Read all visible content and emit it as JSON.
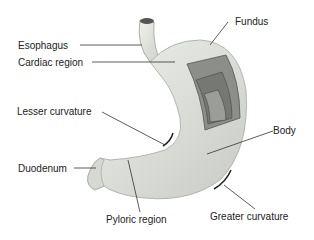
{
  "labels": {
    "esophagus": "Esophagus",
    "cardiac": "Cardiac region",
    "fundus": "Fundus",
    "lesser": "Lesser curvature",
    "body": "Body",
    "duodenum": "Duodenum",
    "pyloric": "Pyloric region",
    "greater": "Greater curvature"
  },
  "colors": {
    "organ_fill": "#e4e6e2",
    "organ_shade": "#c9ccc6",
    "muscle_dark": "#6f726c",
    "muscle_mid": "#8c8f89",
    "leader_line": "#333333"
  }
}
